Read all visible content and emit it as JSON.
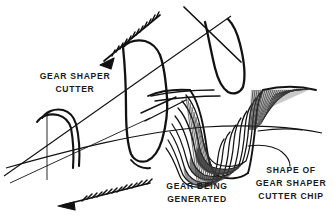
{
  "figure": {
    "background_color": "#ffffff",
    "ink_color": "#121212",
    "shading_color": "#3a3a3a",
    "width": 335,
    "height": 216
  },
  "labels": {
    "cutter": {
      "line1": "GEAR SHAPER",
      "line2": "CUTTER"
    },
    "gear": {
      "line1": "GEAR BEING",
      "line2": "GENERATED"
    },
    "chip": {
      "line1": "SHAPE OF",
      "line2": "GEAR SHAPER",
      "line3": "CUTTER CHIP"
    }
  },
  "annotations": {
    "arrow_upper_name": "cutter-motion-arrow",
    "arrow_lower_name": "gear-motion-arrow",
    "arrow_style": "feathered-barbed",
    "leader_name": "chip-leader-line"
  },
  "geometry": {
    "generated_profile_curve_count": 8,
    "chip_hatch_line_count_right": 30,
    "chip_hatch_line_count_left": 16
  }
}
